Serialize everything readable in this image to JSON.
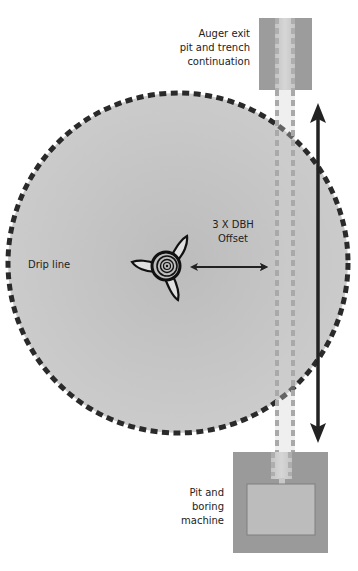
{
  "diagram": {
    "labels": {
      "drip_line": "Drip line",
      "offset_line1": "3 X DBH",
      "offset_line2": "Offset",
      "auger_exit_line1": "Auger exit",
      "auger_exit_line2": "pit and trench",
      "auger_exit_line3": "continuation",
      "pit_line1": "Pit and",
      "pit_line2": "boring",
      "pit_line3": "machine"
    },
    "colors": {
      "canopy_fill": "#c6c6c6",
      "canopy_fill_center": "#bdbdbd",
      "drip_line_stroke": "#2a2a2a",
      "pit_outer": "#9a9a9a",
      "pit_inner": "#bababa",
      "trench_fill": "#d0d0d0",
      "trench_dash": "#a8a8a8",
      "arrow": "#222222",
      "trunk": "#111111"
    },
    "elements": {
      "canopy": {
        "cx": 178,
        "cy": 263,
        "r": 170
      },
      "trunk": {
        "cx": 166,
        "cy": 266
      },
      "auger_exit_pit": {
        "x": 259,
        "y": 18,
        "w": 53,
        "h": 72
      },
      "boring_pit": {
        "x": 233,
        "y": 452,
        "w": 95,
        "h": 101
      },
      "machine": {
        "x": 247,
        "y": 484,
        "w": 68,
        "h": 51
      },
      "offset_arrow": {
        "x1": 190,
        "x2": 268,
        "y": 267
      },
      "trench_length_arrow": {
        "x": 318,
        "y1": 103,
        "y2": 443
      }
    }
  }
}
